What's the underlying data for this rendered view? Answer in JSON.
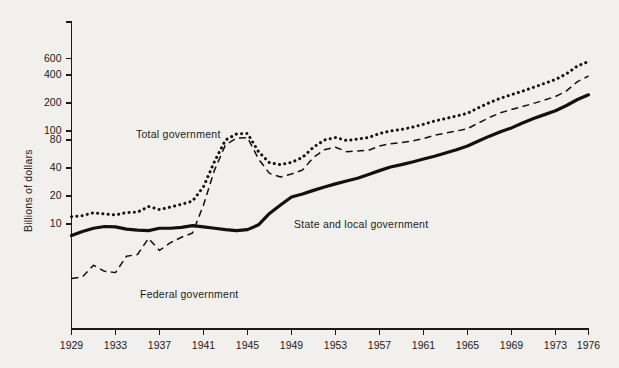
{
  "chart_data": {
    "type": "line",
    "title": "",
    "subtitle": "",
    "xlabel": "",
    "ylabel": "Billions of dollars",
    "scale": {
      "x": "linear",
      "y": "log"
    },
    "grid": false,
    "legend_position": "inline-annotations",
    "xlim": [
      1929,
      1976
    ],
    "ylim": [
      1.8,
      800
    ],
    "xticks": [
      1929,
      1933,
      1937,
      1941,
      1945,
      1949,
      1953,
      1957,
      1961,
      1965,
      1969,
      1973,
      1976
    ],
    "xtick_labels": [
      "1929",
      "1933",
      "1937",
      "1941",
      "1945",
      "1949",
      "1953",
      "1957",
      "1961",
      "1965",
      "1969",
      "1973",
      "1976"
    ],
    "yticks": [
      10,
      20,
      40,
      80,
      100,
      200,
      400,
      600
    ],
    "ytick_labels": [
      "10",
      "20",
      "40",
      "80",
      "100",
      "200",
      "400",
      "600"
    ],
    "x": [
      1929,
      1930,
      1931,
      1932,
      1933,
      1934,
      1935,
      1936,
      1937,
      1938,
      1939,
      1940,
      1941,
      1942,
      1943,
      1944,
      1945,
      1946,
      1947,
      1948,
      1949,
      1950,
      1951,
      1952,
      1953,
      1954,
      1955,
      1956,
      1957,
      1958,
      1959,
      1960,
      1961,
      1962,
      1963,
      1964,
      1965,
      1966,
      1967,
      1968,
      1969,
      1970,
      1971,
      1972,
      1973,
      1974,
      1975,
      1976
    ],
    "series": [
      {
        "name": "Total government",
        "style": "dotted",
        "annotation": "Total government",
        "color": "#111111",
        "values": [
          12.0,
          12.3,
          13.2,
          12.8,
          12.5,
          13.3,
          13.4,
          15.4,
          14.3,
          15.2,
          16.3,
          17.6,
          25.2,
          47.0,
          80.0,
          93.0,
          94.0,
          60.0,
          45.5,
          43.5,
          46.0,
          52.0,
          67.0,
          80.0,
          85.0,
          79.0,
          82.0,
          85.0,
          94.0,
          100.0,
          104.0,
          110.0,
          118.0,
          128.0,
          136.0,
          145.0,
          155.0,
          178.0,
          202.0,
          225.0,
          246.0,
          268.0,
          295.0,
          325.0,
          358.0,
          412.0,
          500.0,
          560.0
        ]
      },
      {
        "name": "Federal government",
        "style": "dashed",
        "annotation": "Federal government",
        "color": "#111111",
        "values": [
          2.6,
          2.7,
          3.6,
          3.1,
          3.0,
          4.5,
          4.7,
          7.0,
          5.2,
          6.3,
          7.2,
          8.0,
          16.0,
          38.0,
          71.0,
          84.0,
          85.0,
          50.0,
          35.0,
          32.0,
          34.5,
          38.0,
          52.0,
          63.0,
          67.0,
          60.0,
          61.0,
          62.0,
          69.0,
          73.0,
          75.0,
          78.0,
          83.0,
          90.0,
          95.0,
          100.0,
          106.0,
          122.0,
          140.0,
          157.0,
          170.0,
          183.0,
          198.0,
          215.0,
          235.0,
          270.0,
          340.0,
          390.0
        ]
      },
      {
        "name": "State and local government",
        "style": "solid",
        "annotation": "State and local government",
        "color": "#111111",
        "values": [
          7.5,
          8.3,
          9.0,
          9.4,
          9.3,
          8.8,
          8.6,
          8.5,
          9.0,
          9.0,
          9.2,
          9.6,
          9.3,
          9.0,
          8.7,
          8.5,
          8.7,
          9.8,
          13.0,
          16.0,
          19.5,
          21.0,
          23.0,
          25.0,
          27.0,
          29.0,
          31.0,
          34.0,
          37.5,
          41.0,
          43.5,
          46.5,
          50.0,
          53.5,
          58.0,
          63.0,
          69.0,
          78.0,
          88.0,
          98.0,
          108.0,
          122.0,
          136.0,
          150.0,
          165.0,
          188.0,
          218.0,
          245.0
        ]
      }
    ]
  },
  "annotations": {
    "total": "Total government",
    "federal": "Federal government",
    "state_local": "State and local government"
  },
  "axis": {
    "ylabel": "Billions of dollars"
  }
}
